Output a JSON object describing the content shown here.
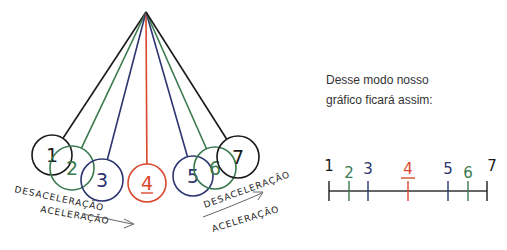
{
  "pendulum": {
    "pivot": {
      "x": 146,
      "y": 12
    },
    "balls": [
      {
        "label": "1",
        "cx": 52,
        "cy": 155,
        "r": 20,
        "color": "#1a1a1a"
      },
      {
        "label": "2",
        "cx": 72,
        "cy": 168,
        "r": 22,
        "color": "#3a7a4e"
      },
      {
        "label": "3",
        "cx": 102,
        "cy": 180,
        "r": 21,
        "color": "#2c3570"
      },
      {
        "label": "4",
        "cx": 147,
        "cy": 183,
        "r": 19,
        "color": "#d9482f"
      },
      {
        "label": "5",
        "cx": 193,
        "cy": 176,
        "r": 20,
        "color": "#2c3570"
      },
      {
        "label": "6",
        "cx": 215,
        "cy": 168,
        "r": 21,
        "color": "#3a7a4e"
      },
      {
        "label": "7",
        "cx": 238,
        "cy": 157,
        "r": 21,
        "color": "#1a1a1a"
      }
    ],
    "left_labels": {
      "top": "DESACELERAÇÃO",
      "bottom": "ACELERAÇÃO"
    },
    "right_labels": {
      "top": "DESACELERAÇÃO",
      "bottom": "ACELERAÇÃO"
    }
  },
  "caption": {
    "line1": "Desse modo nosso",
    "line2": "gráfico ficará assim:"
  },
  "timeline": {
    "y": 191,
    "x_start": 329,
    "x_end": 487,
    "ticks": [
      {
        "label": "1",
        "x": 329,
        "color": "#1a1a1a"
      },
      {
        "label": "2",
        "x": 349,
        "color": "#3a7a4e"
      },
      {
        "label": "3",
        "x": 368,
        "color": "#2c3570"
      },
      {
        "label": "4",
        "x": 408,
        "color": "#d9482f"
      },
      {
        "label": "5",
        "x": 448,
        "color": "#2c3570"
      },
      {
        "label": "6",
        "x": 468,
        "color": "#3a7a4e"
      },
      {
        "label": "7",
        "x": 487,
        "color": "#1a1a1a"
      }
    ]
  }
}
